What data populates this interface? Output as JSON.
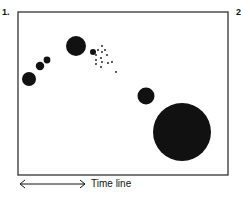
{
  "panel_labels": [
    "1.",
    "2."
  ],
  "frame": {
    "x": 18,
    "y": 12,
    "width": 210,
    "height": 163,
    "stroke": "#333333"
  },
  "colors": {
    "ink": "#111111",
    "frame": "#333333",
    "background": "#ffffff"
  },
  "circles": [
    {
      "cx": 29,
      "cy": 79,
      "r": 7
    },
    {
      "cx": 40,
      "cy": 66,
      "r": 4.2
    },
    {
      "cx": 47,
      "cy": 60,
      "r": 3.4
    },
    {
      "cx": 76,
      "cy": 46,
      "r": 10
    },
    {
      "cx": 93,
      "cy": 52,
      "r": 3
    },
    {
      "cx": 146,
      "cy": 96,
      "r": 8.5
    },
    {
      "cx": 182,
      "cy": 132,
      "r": 29
    }
  ],
  "dots": [
    {
      "cx": 102,
      "cy": 46
    },
    {
      "cx": 98,
      "cy": 50
    },
    {
      "cx": 96,
      "cy": 55
    },
    {
      "cx": 102,
      "cy": 52
    },
    {
      "cx": 105,
      "cy": 50
    },
    {
      "cx": 96,
      "cy": 60
    },
    {
      "cx": 101,
      "cy": 58
    },
    {
      "cx": 107,
      "cy": 55
    },
    {
      "cx": 96,
      "cy": 64
    },
    {
      "cx": 102,
      "cy": 62
    },
    {
      "cx": 101,
      "cy": 67
    },
    {
      "cx": 108,
      "cy": 63
    },
    {
      "cx": 112,
      "cy": 62
    },
    {
      "cx": 116,
      "cy": 72
    }
  ],
  "time_axis": {
    "label": "Time line",
    "x1": 20,
    "x2": 85,
    "y": 184
  }
}
